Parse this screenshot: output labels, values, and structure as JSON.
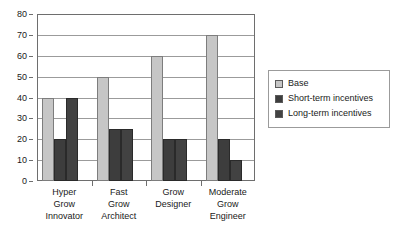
{
  "chart_data": {
    "type": "bar",
    "title": "",
    "xlabel": "",
    "ylabel": "",
    "ylim": [
      0,
      80
    ],
    "ytick_step": 10,
    "yticks": [
      "0",
      "10",
      "20",
      "30",
      "40",
      "50",
      "60",
      "70",
      "80"
    ],
    "grid": true,
    "legend_position": "right",
    "categories": [
      "Hyper Grow Innovator",
      "Fast Grow Architect",
      "Grow Designer",
      "Moderate Grow Engineer"
    ],
    "category_lines": [
      [
        "Hyper",
        "Grow",
        "Innovator"
      ],
      [
        "Fast",
        "Grow",
        "Architect"
      ],
      [
        "Grow",
        "Designer"
      ],
      [
        "Moderate",
        "Grow",
        "Engineer"
      ]
    ],
    "series": [
      {
        "name": "Base",
        "color": "#c6c6c6",
        "values": [
          40,
          50,
          60,
          70
        ]
      },
      {
        "name": "Short-term incentives",
        "color": "#3d3d3d",
        "values": [
          20,
          25,
          20,
          20
        ]
      },
      {
        "name": "Long-term incentives",
        "color": "#424242",
        "values": [
          40,
          25,
          20,
          10
        ]
      }
    ]
  },
  "legend": {
    "items": [
      {
        "label": "Base"
      },
      {
        "label": "Short-term incentives"
      },
      {
        "label": "Long-term incentives"
      }
    ]
  }
}
